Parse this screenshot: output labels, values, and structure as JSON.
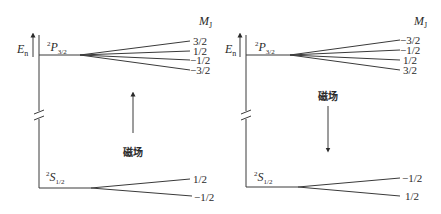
{
  "diagrams": [
    {
      "id": "field-up",
      "energy_axis_label": "E",
      "energy_axis_sub": "n",
      "mj_header": "M",
      "mj_header_sub": "J",
      "upper_level": {
        "term_sup": "2",
        "term": "P",
        "term_sub": "3/2",
        "sublevels": [
          "3/2",
          "1/2",
          "−1/2",
          "−3/2"
        ]
      },
      "lower_level": {
        "term_sup": "2",
        "term": "S",
        "term_sub": "1/2",
        "sublevels": [
          "1/2",
          "−1/2"
        ]
      },
      "field_label": "磁场",
      "field_direction": "up"
    },
    {
      "id": "field-down",
      "energy_axis_label": "E",
      "energy_axis_sub": "n",
      "mj_header": "M",
      "mj_header_sub": "J",
      "upper_level": {
        "term_sup": "2",
        "term": "P",
        "term_sub": "3/2",
        "sublevels": [
          "−3/2",
          "−1/2",
          "1/2",
          "3/2"
        ]
      },
      "lower_level": {
        "term_sup": "2",
        "term": "S",
        "term_sub": "1/2",
        "sublevels": [
          "−1/2",
          "1/2"
        ]
      },
      "field_label": "磁场",
      "field_direction": "down"
    }
  ]
}
